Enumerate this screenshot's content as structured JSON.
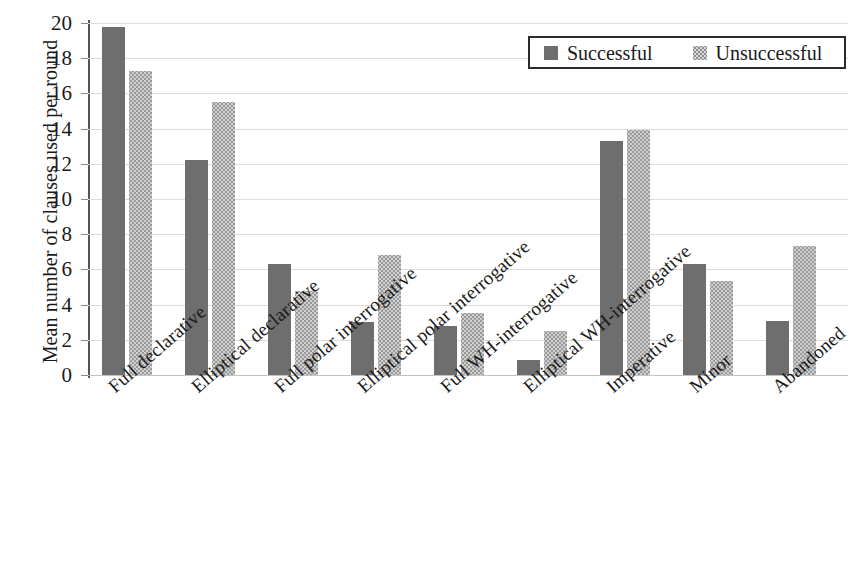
{
  "chart_data": {
    "type": "bar",
    "title": "",
    "xlabel": "",
    "ylabel": "Mean number of clauses used per round",
    "ylim": [
      0,
      20
    ],
    "ytick_step": 2,
    "yticks": [
      "0",
      "2",
      "4",
      "6",
      "8",
      "10",
      "12",
      "14",
      "16",
      "18",
      "20"
    ],
    "grid": true,
    "legend_position": "top-right",
    "categories": [
      "Full declarative",
      "Elliptical declarative",
      "Full polar interrogative",
      "Elliptical polar interrogative",
      "Full WH-interrogative",
      "Elliptical WH-interrogative",
      "Imperative",
      "Minor",
      "Abandoned"
    ],
    "series": [
      {
        "name": "Successful",
        "color": "#6e6e6e",
        "pattern": "solid",
        "values": [
          19.8,
          12.2,
          6.3,
          3.0,
          2.8,
          0.85,
          13.3,
          6.3,
          3.05
        ]
      },
      {
        "name": "Unsuccessful",
        "color": "#cfcfcf",
        "pattern": "dotted",
        "values": [
          17.3,
          15.5,
          4.8,
          6.8,
          3.55,
          2.5,
          13.9,
          5.35,
          7.35
        ]
      }
    ]
  },
  "legend": {
    "items": [
      {
        "label": "Successful"
      },
      {
        "label": "Unsuccessful"
      }
    ]
  },
  "axis": {
    "y_title": "Mean number of clauses used per round"
  }
}
